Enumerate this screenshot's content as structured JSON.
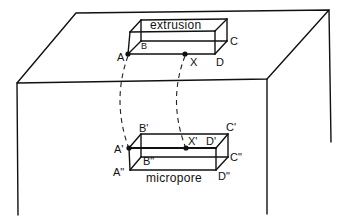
{
  "diagram": {
    "type": "schematic",
    "extrusion": {
      "title": "extrusion",
      "labels": {
        "A": "A",
        "B": "B",
        "C": "C",
        "D": "D",
        "X": "X"
      }
    },
    "micropore": {
      "title": "micropore",
      "labels": {
        "A1": "A'",
        "B1": "B'",
        "C1": "C'",
        "D1": "D'",
        "X1": "X'",
        "A2": "A\"",
        "B2": "B\"",
        "C2": "C\"",
        "D2": "D\""
      }
    },
    "connectors": [
      {
        "from": "A",
        "to": "A'",
        "style": "dashed"
      },
      {
        "from": "X",
        "to": "X'",
        "style": "dashed"
      }
    ],
    "colors": {
      "line": "#111111",
      "background": "#ffffff"
    }
  }
}
